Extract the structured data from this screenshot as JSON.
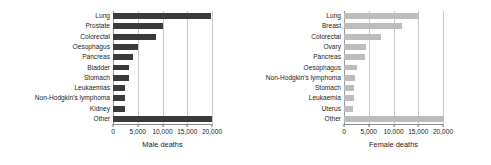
{
  "chart_data": [
    {
      "type": "bar",
      "orientation": "horizontal",
      "title": "",
      "xlabel": "Male deaths",
      "ylabel": "",
      "categories": [
        "Lung",
        "Prostate",
        "Colorectal",
        "Oesophagus",
        "Pancreas",
        "Bladder",
        "Stomach",
        "Leukaemias",
        "Non-Hodgkin's lymphoma",
        "Kidney",
        "Other"
      ],
      "values": [
        19800,
        10000,
        8700,
        5000,
        4100,
        3300,
        3300,
        2500,
        2400,
        2400,
        20100
      ],
      "xlim": [
        0,
        20000
      ],
      "xticks": [
        0,
        5000,
        10000,
        15000,
        20000
      ],
      "xticklabels": [
        "0",
        "5,000",
        "10,000",
        "15,000",
        "20,000"
      ],
      "grid": true,
      "bar_color": "#3b3b3b"
    },
    {
      "type": "bar",
      "orientation": "horizontal",
      "title": "",
      "xlabel": "Female deaths",
      "ylabel": "",
      "categories": [
        "Lung",
        "Breast",
        "Colorectal",
        "Ovary",
        "Pancreas",
        "Oesophagus",
        "Non-Hodgkin's lymphoma",
        "Stomach",
        "Leukaemia",
        "Uterus",
        "Other"
      ],
      "values": [
        15200,
        11800,
        7500,
        4400,
        4200,
        2700,
        2300,
        2100,
        2000,
        1900,
        21500
      ],
      "xlim": [
        0,
        20000
      ],
      "xticks": [
        0,
        5000,
        10000,
        15000,
        20000
      ],
      "xticklabels": [
        "0",
        "5,000",
        "10,000",
        "15,000",
        "20,000"
      ],
      "grid": true,
      "bar_color": "#bdbdbd"
    }
  ]
}
